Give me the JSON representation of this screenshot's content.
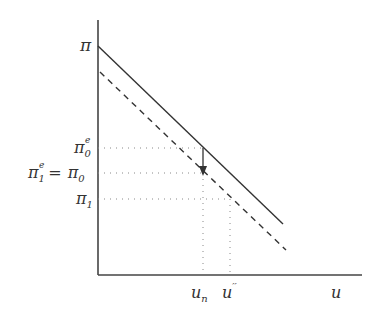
{
  "diagram": {
    "type": "phillips-curve",
    "y_axis_label": "π",
    "x_axis_label": "u",
    "y_ticks": [
      {
        "base": "π",
        "sub": "0",
        "sup": "e",
        "prefix": ""
      },
      {
        "base": "π",
        "sub": "0",
        "sup": "",
        "prefix": "π₁ᵉ ="
      },
      {
        "base": "π",
        "sub": "1",
        "sup": "",
        "prefix": ""
      }
    ],
    "x_ticks": [
      {
        "base": "u",
        "sub": "n",
        "sup": ""
      },
      {
        "base": "u",
        "sub": "",
        "sup": "′′"
      }
    ],
    "curves": [
      {
        "name": "original-phillips-curve",
        "style": "solid"
      },
      {
        "name": "shifted-phillips-curve",
        "style": "dashed"
      }
    ],
    "arrow": "downward shift from π0e to π0 at un",
    "colors": {
      "line": "#333333",
      "dotted": "#888888"
    }
  }
}
